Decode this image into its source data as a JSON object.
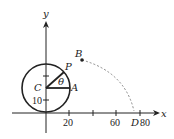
{
  "diagram": {
    "axes": {
      "x_label": "x",
      "y_label": "y",
      "x_ticks": [
        {
          "label": "20",
          "value": 20
        },
        {
          "label": "",
          "value": 40
        },
        {
          "label": "60",
          "value": 60
        },
        {
          "label": "80",
          "value": 80
        }
      ],
      "y_ticks": [
        {
          "label": "10",
          "value": 10
        },
        {
          "label": "",
          "value": 30
        }
      ]
    },
    "points": {
      "C": "C",
      "P": "P",
      "A": "A",
      "B": "B",
      "D": "D"
    },
    "angle_label": "θ",
    "labels": {
      "x_tick_20": "20",
      "x_tick_60": "60",
      "x_tick_80": "80",
      "y_tick_10": "10"
    },
    "colors": {
      "stroke": "#222222",
      "dashed": "#888888"
    }
  }
}
